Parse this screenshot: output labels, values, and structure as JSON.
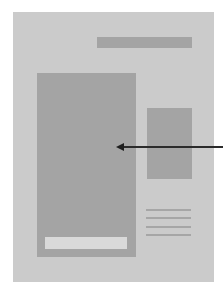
{
  "diagram": {
    "colors": {
      "background": "#ffffff",
      "page": "#cbcbcb",
      "blocks": "#a4a4a4",
      "caption_box": "#d9d9d9",
      "arrow": "#1e1e1e"
    },
    "elements": [
      {
        "id": "page",
        "type": "container"
      },
      {
        "id": "top-bar",
        "type": "placeholder-block"
      },
      {
        "id": "main-panel",
        "type": "placeholder-block",
        "contains": "caption-box"
      },
      {
        "id": "side-panel",
        "type": "placeholder-block"
      },
      {
        "id": "text-lines",
        "type": "text-placeholder",
        "count": 4
      },
      {
        "id": "arrow",
        "type": "pointer",
        "target": "main-panel",
        "direction": "right-to-left"
      }
    ],
    "text_lines": [
      {
        "top": 197
      },
      {
        "top": 205
      },
      {
        "top": 214
      },
      {
        "top": 222
      }
    ]
  }
}
